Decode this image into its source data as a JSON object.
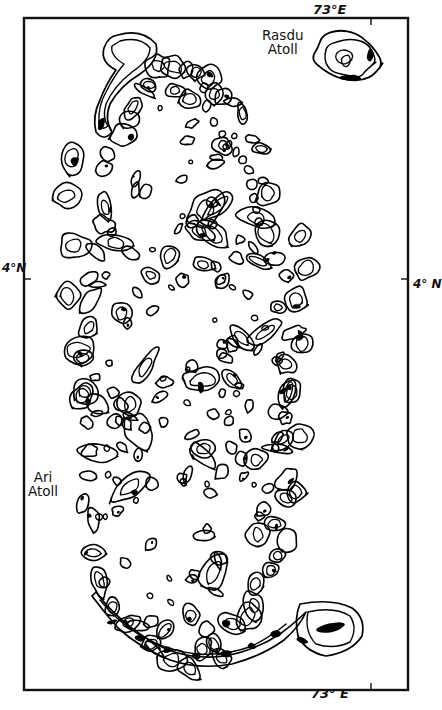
{
  "map": {
    "title": "Ari Atoll and Rasdu Atoll, Maldives",
    "type": "line-drawing reef map",
    "background_color": "#ffffff",
    "line_color": "#000000",
    "fill_color": "#000000",
    "frame": {
      "x": 24,
      "y": 18,
      "width": 384,
      "height": 672,
      "stroke_width": 2.2,
      "ticks": [
        {
          "name": "tick-top-73E",
          "edge": "top",
          "x": 371
        },
        {
          "name": "tick-bottom-73E",
          "edge": "bottom",
          "x": 371
        },
        {
          "name": "tick-left-4N",
          "edge": "left",
          "y": 279
        },
        {
          "name": "tick-right-4N",
          "edge": "right",
          "y": 279
        }
      ]
    },
    "coordinate_labels": {
      "top": "73°E",
      "bottom": "73° E",
      "left": "4°N",
      "right": "4° N"
    },
    "place_labels": [
      {
        "name": "rasdu-atoll-label",
        "text": "Rasdu\nAtoll",
        "x": 262,
        "y": 28
      },
      {
        "name": "ari-atoll-label",
        "text": "Ari\nAtoll",
        "x": 28,
        "y": 470
      }
    ]
  },
  "chart_data": {
    "type": "map",
    "features": [
      {
        "id": "rasdu-atoll",
        "label": "Rasdu Atoll",
        "kind": "atoll-rim",
        "centroid": [
          348,
          58
        ]
      },
      {
        "id": "ari-atoll",
        "label": "Ari Atoll",
        "kind": "atoll-complex",
        "centroid": [
          185,
          360
        ]
      }
    ],
    "reef_count_approx": 190,
    "legend": "none",
    "grid": "false",
    "xlabel": "73° E",
    "ylabel": "4° N"
  }
}
